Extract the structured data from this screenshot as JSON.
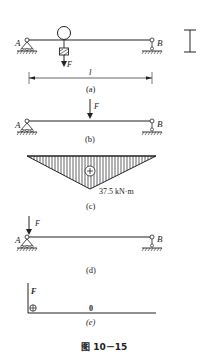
{
  "figure": {
    "caption": "图 10－15",
    "colors": {
      "ink": "#222222",
      "background": "#ffffff"
    }
  },
  "panels": {
    "a": {
      "label": "(a)",
      "support_left": "A",
      "support_right": "B",
      "load": "F",
      "span": "l",
      "section_icon": "I-beam-icon"
    },
    "b": {
      "label": "(b)",
      "support_left": "A",
      "support_right": "B",
      "load": "F"
    },
    "c": {
      "label": "(c)",
      "sign": "⊕",
      "max_moment": "37.5 kN·m"
    },
    "d": {
      "label": "(d)",
      "support_left": "A",
      "support_right": "B",
      "load": "F"
    },
    "e": {
      "label": "(e)",
      "axis_label": "F",
      "sign": "⊕",
      "value": "0"
    }
  }
}
